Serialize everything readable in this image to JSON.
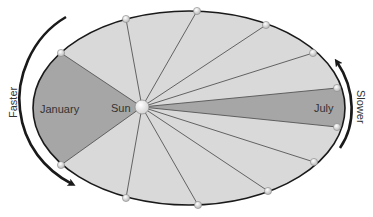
{
  "diagram": {
    "type": "kepler-second-law-orbit",
    "labels": {
      "january": "January",
      "sun": "Sun",
      "july": "July",
      "faster": "Faster",
      "slower": "Slower"
    },
    "colors": {
      "background": "#ffffff",
      "orbit_fill": "#d9d9d9",
      "highlight_sector": "#a6a6a6",
      "orbit_stroke": "#1a1a1a",
      "spoke_stroke": "#555555",
      "point_fill": "#e6e6e6",
      "sun_fill": "#f2f2f2",
      "arrow": "#1a1a1a",
      "text": "#333333"
    },
    "orbit": {
      "cx": 189,
      "cy": 108,
      "rx": 156,
      "ry": 97
    },
    "sun": {
      "x": 142,
      "y": 107,
      "r": 7
    },
    "orbit_points": [
      [
        61,
        53
      ],
      [
        126,
        19
      ],
      [
        197,
        11
      ],
      [
        266,
        25
      ],
      [
        313,
        53
      ],
      [
        337,
        88
      ],
      [
        337,
        127
      ],
      [
        314,
        162
      ],
      [
        268,
        191
      ],
      [
        198,
        205
      ],
      [
        126,
        198
      ],
      [
        61,
        165
      ]
    ],
    "highlighted_sectors": [
      "January",
      "July"
    ]
  }
}
